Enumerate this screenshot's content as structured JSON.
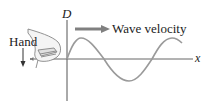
{
  "diagram": {
    "labels": {
      "vertical_axis": "D",
      "horizontal_axis": "x",
      "arrow": "Wave velocity",
      "hand": "Hand"
    },
    "colors": {
      "axis": "#555555",
      "wave": "#9a9a9a",
      "arrow": "#808080",
      "text": "#222222"
    }
  }
}
